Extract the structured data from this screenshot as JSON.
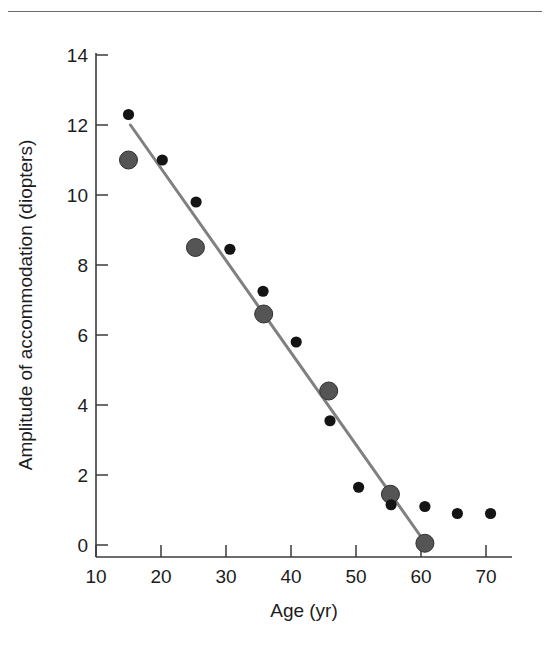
{
  "figure": {
    "has_top_rule": true,
    "background_color": "#ffffff"
  },
  "chart_data": {
    "type": "scatter",
    "title": "",
    "xlabel": "Age (yr)",
    "ylabel": "Amplitude of accommodation (diopters)",
    "xlim": [
      10,
      72
    ],
    "ylim": [
      0,
      14
    ],
    "xticks": [
      10,
      20,
      30,
      40,
      50,
      60,
      70
    ],
    "xtick_labels": [
      "10",
      "20",
      "30",
      "40",
      "50",
      "60",
      "70"
    ],
    "yticks": [
      0,
      2,
      4,
      6,
      8,
      10,
      12,
      14
    ],
    "ytick_labels": [
      "0",
      "2",
      "4",
      "6",
      "8",
      "10",
      "12",
      "14"
    ],
    "grid": false,
    "legend": false,
    "series": [
      {
        "name": "small-black-markers",
        "marker": "circle",
        "marker_size": "small",
        "color": "#141414",
        "points": [
          {
            "x": 15.0,
            "y": 12.3
          },
          {
            "x": 20.2,
            "y": 11.0
          },
          {
            "x": 25.4,
            "y": 9.8
          },
          {
            "x": 30.6,
            "y": 8.45
          },
          {
            "x": 35.7,
            "y": 7.25
          },
          {
            "x": 40.8,
            "y": 5.8
          },
          {
            "x": 46.0,
            "y": 3.55
          },
          {
            "x": 50.4,
            "y": 1.65
          },
          {
            "x": 55.4,
            "y": 1.15
          },
          {
            "x": 60.6,
            "y": 1.1
          },
          {
            "x": 65.6,
            "y": 0.9
          },
          {
            "x": 70.7,
            "y": 0.9
          }
        ]
      },
      {
        "name": "large-gray-markers",
        "marker": "circle",
        "marker_size": "large",
        "color": "#555555",
        "points": [
          {
            "x": 15.0,
            "y": 11.0
          },
          {
            "x": 25.3,
            "y": 8.5
          },
          {
            "x": 35.8,
            "y": 6.6
          },
          {
            "x": 45.8,
            "y": 4.4
          },
          {
            "x": 55.3,
            "y": 1.45
          },
          {
            "x": 60.6,
            "y": 0.05
          }
        ]
      }
    ],
    "trend_line": {
      "name": "regression-line",
      "color": "#808080",
      "x_start": 15.3,
      "y_start": 12.0,
      "x_end": 60.7,
      "y_end": 0.05
    }
  },
  "axis_geometry": {
    "x_pixel_10": 96,
    "x_pixel_per_year": 6.5,
    "y_pixel_0": 545,
    "y_pixel_per_unit": 35.0
  }
}
